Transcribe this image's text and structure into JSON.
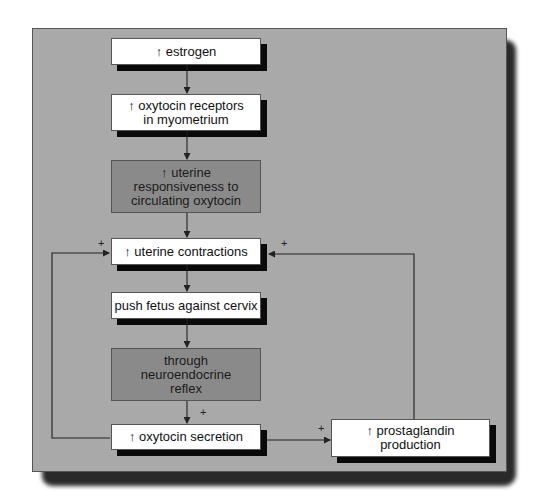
{
  "diagram": {
    "type": "flowchart",
    "topic": "positive feedback in labor",
    "up_arrow_symbol": "🠕",
    "nodes": [
      {
        "id": "estrogen",
        "lines": [
          "↑ estrogen"
        ],
        "style": "light"
      },
      {
        "id": "receptors",
        "lines": [
          "↑ oxytocin receptors",
          "in myometrium"
        ],
        "style": "light"
      },
      {
        "id": "responsiveness",
        "lines": [
          "↑ uterine",
          "responsiveness to",
          "circulating oxytocin"
        ],
        "style": "dark"
      },
      {
        "id": "contractions",
        "lines": [
          "↑ uterine contractions"
        ],
        "style": "light"
      },
      {
        "id": "push",
        "lines": [
          "push fetus against cervix"
        ],
        "style": "light"
      },
      {
        "id": "reflex",
        "lines": [
          "through",
          "neuroendocrine",
          "reflex"
        ],
        "style": "dark"
      },
      {
        "id": "oxytocin",
        "lines": [
          "↑ oxytocin secretion"
        ],
        "style": "light"
      },
      {
        "id": "prostaglandin",
        "lines": [
          "↑ prostaglandin",
          "production"
        ],
        "style": "light"
      }
    ],
    "edges": [
      {
        "from": "estrogen",
        "to": "receptors",
        "sign": ""
      },
      {
        "from": "receptors",
        "to": "responsiveness",
        "sign": ""
      },
      {
        "from": "responsiveness",
        "to": "contractions",
        "sign": ""
      },
      {
        "from": "contractions",
        "to": "push",
        "sign": ""
      },
      {
        "from": "push",
        "to": "reflex",
        "sign": ""
      },
      {
        "from": "reflex",
        "to": "oxytocin",
        "sign": "+"
      },
      {
        "from": "oxytocin",
        "to": "contractions",
        "sign": "+"
      },
      {
        "from": "oxytocin",
        "to": "prostaglandin",
        "sign": "+"
      },
      {
        "from": "prostaglandin",
        "to": "contractions",
        "sign": "+"
      }
    ],
    "plus_sign": "+"
  }
}
